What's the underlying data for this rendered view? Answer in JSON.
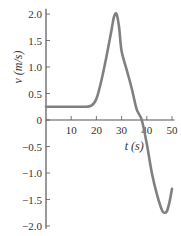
{
  "chart_data": {
    "type": "line",
    "title": "",
    "xlabel": "t (s)",
    "ylabel": "v (m/s)",
    "xlim": [
      0,
      51
    ],
    "ylim": [
      -2.0,
      2.0
    ],
    "x_ticks": [
      10,
      20,
      30,
      40,
      50
    ],
    "y_ticks": [
      2.0,
      1.5,
      1.0,
      0.5,
      0,
      -0.5,
      -1.0,
      -1.5,
      -2.0
    ],
    "x_tick_labels": [
      "10",
      "20",
      "30",
      "40",
      "50"
    ],
    "y_tick_labels": [
      "2.0",
      "1.5",
      "1.0",
      "0.5",
      "0",
      "−0.5",
      "−1.0",
      "−1.5",
      "−2.0"
    ],
    "grid": false,
    "legend": null,
    "series": [
      {
        "name": "v(t)",
        "color": "#808080",
        "x": [
          0,
          5,
          10,
          15,
          18,
          20,
          22,
          24,
          26,
          27,
          28,
          29,
          30,
          32,
          34,
          36,
          38,
          40,
          42,
          44,
          46,
          47,
          48,
          49,
          50
        ],
        "values": [
          0.25,
          0.25,
          0.25,
          0.25,
          0.27,
          0.4,
          0.75,
          1.2,
          1.7,
          1.95,
          2.0,
          1.75,
          1.3,
          0.95,
          0.6,
          0.2,
          0.0,
          -0.45,
          -1.0,
          -1.4,
          -1.7,
          -1.75,
          -1.72,
          -1.55,
          -1.3
        ]
      }
    ]
  }
}
